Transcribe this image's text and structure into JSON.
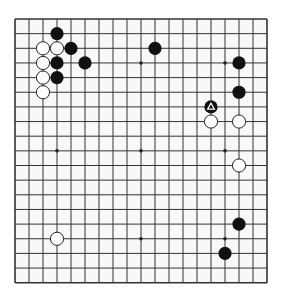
{
  "diagram": {
    "type": "go-board",
    "size": 19,
    "colors": {
      "background": "#f8f8f8",
      "line": "#333333",
      "black": "#111111",
      "white": "#ffffff",
      "star": "#222222"
    },
    "star_points": [
      [
        3,
        3
      ],
      [
        9,
        3
      ],
      [
        15,
        3
      ],
      [
        3,
        9
      ],
      [
        9,
        9
      ],
      [
        15,
        9
      ],
      [
        3,
        15
      ],
      [
        9,
        15
      ],
      [
        15,
        15
      ]
    ],
    "stones": [
      {
        "color": "black",
        "col": 3,
        "row": 1
      },
      {
        "color": "white",
        "col": 2,
        "row": 2
      },
      {
        "color": "white",
        "col": 3,
        "row": 2
      },
      {
        "color": "black",
        "col": 4,
        "row": 2
      },
      {
        "color": "white",
        "col": 2,
        "row": 3
      },
      {
        "color": "black",
        "col": 3,
        "row": 3
      },
      {
        "color": "black",
        "col": 5,
        "row": 3
      },
      {
        "color": "white",
        "col": 2,
        "row": 4
      },
      {
        "color": "black",
        "col": 3,
        "row": 4
      },
      {
        "color": "white",
        "col": 2,
        "row": 5
      },
      {
        "color": "black",
        "col": 10,
        "row": 2
      },
      {
        "color": "black",
        "col": 16,
        "row": 3
      },
      {
        "color": "black",
        "col": 16,
        "row": 5
      },
      {
        "color": "black",
        "col": 14,
        "row": 6,
        "marker": "triangle"
      },
      {
        "color": "white",
        "col": 14,
        "row": 7
      },
      {
        "color": "white",
        "col": 16,
        "row": 7
      },
      {
        "color": "white",
        "col": 16,
        "row": 10
      },
      {
        "color": "black",
        "col": 16,
        "row": 14
      },
      {
        "color": "black",
        "col": 15,
        "row": 16
      },
      {
        "color": "white",
        "col": 3,
        "row": 15
      }
    ]
  }
}
